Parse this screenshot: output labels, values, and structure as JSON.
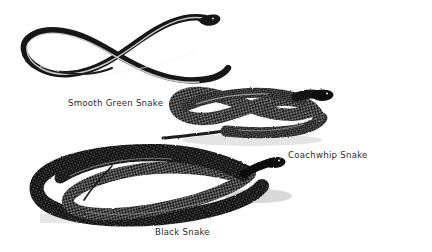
{
  "plate": {
    "title": "Three North American Snakes",
    "background_color": "#ffffff",
    "ink_color": "#1a1a1a",
    "caption_color": "#2b2b2b",
    "medium": "black-and-white engraving / halftone illustration",
    "width": 432,
    "height": 252
  },
  "figures": [
    {
      "id": "smooth-green-snake",
      "caption": "Smooth Green Snake",
      "caption_position": {
        "x": 68,
        "y": 99
      },
      "pose": "long slender body in an elongated figure-eight with a narrow U-turn loop at left, head at upper right",
      "region": {
        "x": 12,
        "y": 8,
        "width": 212,
        "height": 82
      },
      "body_thickness": 5,
      "tone": "dark with light highlight along the spine"
    },
    {
      "id": "coachwhip-snake",
      "caption": "Coachwhip Snake",
      "caption_position": {
        "x": 288,
        "y": 151
      },
      "pose": "thick coiled body looped over itself with head raised at upper right and slender tail trailing to the left",
      "region": {
        "x": 160,
        "y": 88,
        "width": 175,
        "height": 62
      },
      "body_thickness": 13,
      "tone": "heavily stippled scales, strong dark and light contrast"
    },
    {
      "id": "black-snake",
      "caption": "Black Snake",
      "caption_position": {
        "x": 155,
        "y": 228
      },
      "pose": "large loose double coil filling the lower left, head at right, thin tail tip crossing inside the loop",
      "region": {
        "x": 28,
        "y": 145,
        "width": 250,
        "height": 85
      },
      "body_thickness": 15,
      "tone": "very dark, dense scale texture with cast shadow below"
    }
  ],
  "captions": {
    "green": "Smooth Green Snake",
    "coachwhip": "Coachwhip Snake",
    "black": "Black Snake"
  }
}
